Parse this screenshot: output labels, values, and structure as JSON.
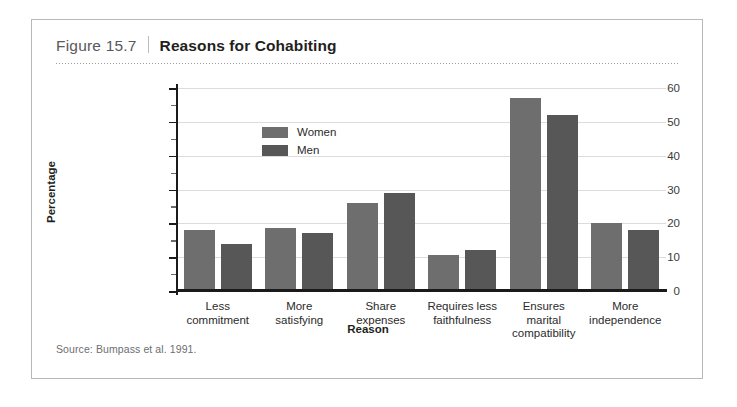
{
  "figure": {
    "number": "Figure 15.7",
    "title": "Reasons for Cohabiting",
    "source": "Source:  Bumpass et al. 1991."
  },
  "colors": {
    "women": "#6e6e6e",
    "men": "#575757",
    "gridline": "#dcdcdc",
    "axis": "#1a1a1a",
    "border": "#b8b8b8"
  },
  "chart_data": {
    "type": "bar",
    "title": "Reasons for Cohabiting",
    "xlabel": "Reason",
    "ylabel": "Percentage",
    "ylim": [
      0,
      60
    ],
    "yticks": [
      0,
      10,
      20,
      30,
      40,
      50,
      60
    ],
    "ytick_labels": [
      "0",
      "10",
      "20",
      "30",
      "40",
      "50",
      "60"
    ],
    "yminor_ticks": [
      5,
      15,
      25,
      35,
      45,
      55
    ],
    "grid": true,
    "legend_position": "upper-left-inside",
    "categories": [
      "Less commitment",
      "More satisfying",
      "Share expenses",
      "Requires less faithfulness",
      "Ensures marital compatibility",
      "More independence"
    ],
    "category_lines": [
      [
        "Less",
        "commitment"
      ],
      [
        "More",
        "satisfying"
      ],
      [
        "Share",
        "expenses"
      ],
      [
        "Requires less",
        "faithfulness"
      ],
      [
        "Ensures",
        "marital",
        "compatibility"
      ],
      [
        "More",
        "independence"
      ]
    ],
    "series": [
      {
        "name": "Women",
        "values": [
          18,
          18.5,
          26,
          10.5,
          57,
          20
        ]
      },
      {
        "name": "Men",
        "values": [
          14,
          17,
          29,
          12,
          52,
          18
        ]
      }
    ]
  }
}
